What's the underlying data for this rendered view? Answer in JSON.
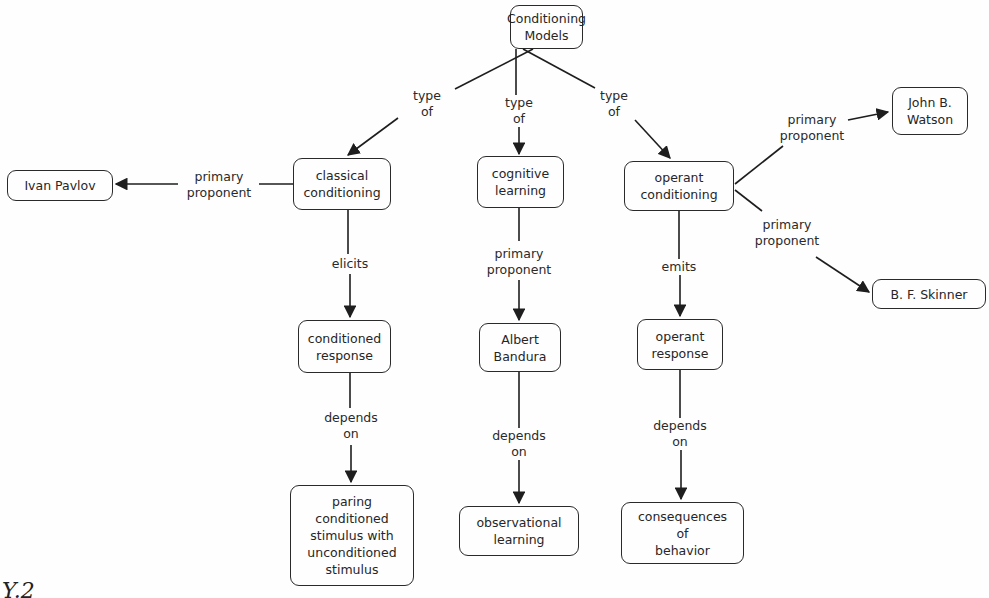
{
  "diagram": {
    "type": "concept-map",
    "root": {
      "label": "Conditioning\nModels"
    },
    "nodes": {
      "classical_conditioning": {
        "label": "classical\nconditioning"
      },
      "cognitive_learning": {
        "label": "cognitive\nlearning"
      },
      "operant_conditioning": {
        "label": "operant\nconditioning"
      },
      "ivan_pavlov": {
        "label": "Ivan Pavlov"
      },
      "john_watson": {
        "label": "John B.\nWatson"
      },
      "bf_skinner": {
        "label": "B. F. Skinner"
      },
      "conditioned_response": {
        "label": "conditioned\nresponse"
      },
      "albert_bandura": {
        "label": "Albert\nBandura"
      },
      "operant_response": {
        "label": "operant\nresponse"
      },
      "paring_stimulus": {
        "label": "paring\nconditioned\nstimulus with\nunconditioned\nstimulus"
      },
      "observational_learning": {
        "label": "observational\nlearning"
      },
      "consequences_behavior": {
        "label": "consequences\nof\nbehavior"
      }
    },
    "links": {
      "type_of_classical": {
        "label": "type\nof"
      },
      "type_of_cognitive": {
        "label": "type\nof"
      },
      "type_of_operant": {
        "label": "type\nof"
      },
      "pavlov_proponent": {
        "label": "primary\nproponent"
      },
      "watson_proponent": {
        "label": "primary\nproponent"
      },
      "skinner_proponent": {
        "label": "primary\nproponent"
      },
      "bandura_proponent": {
        "label": "primary\nproponent"
      },
      "elicits": {
        "label": "elicits"
      },
      "emits": {
        "label": "emits"
      },
      "depends_on_classical": {
        "label": "depends\non"
      },
      "depends_on_cognitive": {
        "label": "depends\non"
      },
      "depends_on_operant": {
        "label": "depends\non"
      }
    },
    "edges": [
      {
        "from": "Conditioning Models",
        "via": "type of",
        "to": "classical conditioning"
      },
      {
        "from": "Conditioning Models",
        "via": "type of",
        "to": "cognitive learning"
      },
      {
        "from": "Conditioning Models",
        "via": "type of",
        "to": "operant conditioning"
      },
      {
        "from": "classical conditioning",
        "via": "primary proponent",
        "to": "Ivan Pavlov"
      },
      {
        "from": "operant conditioning",
        "via": "primary proponent",
        "to": "John B. Watson"
      },
      {
        "from": "operant conditioning",
        "via": "primary proponent",
        "to": "B. F. Skinner"
      },
      {
        "from": "cognitive learning",
        "via": "primary proponent",
        "to": "Albert Bandura"
      },
      {
        "from": "classical conditioning",
        "via": "elicits",
        "to": "conditioned response"
      },
      {
        "from": "operant conditioning",
        "via": "emits",
        "to": "operant response"
      },
      {
        "from": "conditioned response",
        "via": "depends on",
        "to": "paring conditioned stimulus with unconditioned stimulus"
      },
      {
        "from": "Albert Bandura",
        "via": "depends on",
        "to": "observational learning"
      },
      {
        "from": "operant response",
        "via": "depends on",
        "to": "consequences of behavior"
      }
    ]
  },
  "caption_fragment": "Y.2",
  "colors": {
    "line": "#1e1e1e",
    "border": "#2a2a2a",
    "background": "#fefefe",
    "text": "#262626"
  }
}
